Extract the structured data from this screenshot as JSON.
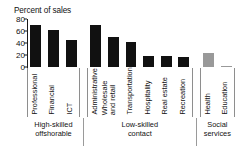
{
  "chart_data": {
    "type": "bar",
    "title": "",
    "ylabel": "Percent of sales",
    "xlabel": "",
    "ylim": [
      0,
      80
    ],
    "yticks": [
      0,
      20,
      40,
      60,
      80
    ],
    "grid": false,
    "legend": "none",
    "categories": [
      "Professional",
      "Financial",
      "ICT",
      "Administrative",
      "Wholesale and retail",
      "Transportation",
      "Hospitality",
      "Real estate",
      "Recreation",
      "Health",
      "Education"
    ],
    "values": [
      70,
      62,
      45,
      70,
      50,
      42,
      19,
      18,
      17,
      24,
      1
    ],
    "bar_colors": [
      "#111111",
      "#111111",
      "#111111",
      "#111111",
      "#111111",
      "#111111",
      "#111111",
      "#111111",
      "#111111",
      "#999999",
      "#999999"
    ],
    "groups": [
      {
        "label": "High-skilled offshorable",
        "line1": "High-skilled",
        "line2": "offshorable",
        "start": 0,
        "end": 2
      },
      {
        "label": "Low-skilled contact",
        "line1": "Low-skilled",
        "line2": "contact",
        "start": 3,
        "end": 8
      },
      {
        "label": "Social services",
        "line1": "Social",
        "line2": "services",
        "start": 9,
        "end": 10
      }
    ]
  },
  "axis": {
    "title": "Percent of sales",
    "tick_80": "80",
    "tick_60": "60",
    "tick_40": "40",
    "tick_20": "20",
    "tick_0": "0"
  },
  "categories": {
    "c0": "Professional",
    "c1": "Financial",
    "c2": "ICT",
    "c3": "Administrative",
    "c4": "Wholesale and retail",
    "c5": "Transportation",
    "c6": "Hospitality",
    "c7": "Real estate",
    "c8": "Recreation",
    "c9": "Health",
    "c10": "Education"
  },
  "groups": {
    "g0_line1": "High-skilled",
    "g0_line2": "offshorable",
    "g1_line1": "Low-skilled",
    "g1_line2": "contact",
    "g2_line1": "Social",
    "g2_line2": "services"
  }
}
